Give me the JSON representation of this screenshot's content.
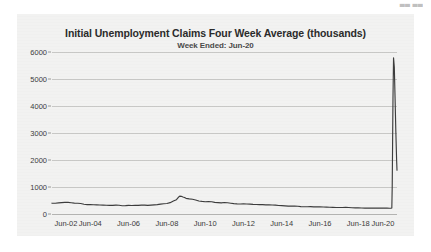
{
  "watermark_fragment": "▄▄ ▄▄",
  "chart_data": {
    "type": "line",
    "title": "Initial Unemployment Claims Four Week Average (thousands)",
    "subtitle": "Week Ended:  Jun-20",
    "xlabel": "",
    "ylabel": "",
    "grid": true,
    "legend": "none",
    "ylim": [
      0,
      6000
    ],
    "yticks": [
      0,
      1000,
      2000,
      3000,
      4000,
      5000,
      6000
    ],
    "ytick_labels": [
      "0",
      "1000",
      "2000",
      "3000",
      "4000",
      "5000",
      "6000"
    ],
    "xlim": [
      2002.45,
      2020.47
    ],
    "xticks": [
      2002.45,
      2004.45,
      2006.45,
      2008.45,
      2010.45,
      2012.45,
      2014.45,
      2016.45,
      2018.45,
      2020.45
    ],
    "xtick_labels": [
      "Jun-02",
      "Jun-04",
      "Jun-06",
      "Jun-08",
      "Jun-10",
      "Jun-12",
      "Jun-14",
      "Jun-16",
      "Jun-18",
      "Jun-20"
    ],
    "series": [
      {
        "name": "Initial Unemployment Claims Four Week Average",
        "color": "#3d3d3d",
        "x": [
          2002.45,
          2002.62,
          2002.79,
          2002.95,
          2003.12,
          2003.29,
          2003.45,
          2003.62,
          2003.79,
          2003.95,
          2004.12,
          2004.29,
          2004.45,
          2004.62,
          2004.79,
          2004.95,
          2005.12,
          2005.29,
          2005.45,
          2005.62,
          2005.79,
          2005.95,
          2006.12,
          2006.29,
          2006.45,
          2006.62,
          2006.79,
          2006.95,
          2007.12,
          2007.29,
          2007.45,
          2007.62,
          2007.79,
          2007.95,
          2008.12,
          2008.29,
          2008.45,
          2008.62,
          2008.79,
          2008.95,
          2009.04,
          2009.12,
          2009.2,
          2009.29,
          2009.37,
          2009.45,
          2009.62,
          2009.79,
          2009.95,
          2010.12,
          2010.29,
          2010.45,
          2010.62,
          2010.79,
          2010.95,
          2011.12,
          2011.29,
          2011.45,
          2011.62,
          2011.79,
          2011.95,
          2012.12,
          2012.29,
          2012.45,
          2012.62,
          2012.79,
          2012.95,
          2013.12,
          2013.29,
          2013.45,
          2013.62,
          2013.79,
          2013.95,
          2014.12,
          2014.29,
          2014.45,
          2014.62,
          2014.79,
          2014.95,
          2015.12,
          2015.29,
          2015.45,
          2015.62,
          2015.79,
          2015.95,
          2016.12,
          2016.29,
          2016.45,
          2016.62,
          2016.79,
          2016.95,
          2017.12,
          2017.29,
          2017.45,
          2017.62,
          2017.79,
          2017.95,
          2018.12,
          2018.29,
          2018.45,
          2018.62,
          2018.79,
          2018.95,
          2019.12,
          2019.29,
          2019.45,
          2019.62,
          2019.79,
          2019.95,
          2020.08,
          2020.16,
          2020.2,
          2020.22,
          2020.24,
          2020.26,
          2020.29,
          2020.33,
          2020.37,
          2020.41,
          2020.45,
          2020.47
        ],
        "y": [
          400,
          398,
          410,
          420,
          430,
          428,
          418,
          405,
          398,
          388,
          360,
          348,
          345,
          342,
          338,
          332,
          330,
          325,
          322,
          320,
          330,
          324,
          305,
          310,
          318,
          316,
          320,
          322,
          330,
          328,
          322,
          330,
          340,
          348,
          365,
          380,
          388,
          420,
          480,
          530,
          610,
          660,
          655,
          630,
          610,
          580,
          560,
          545,
          520,
          480,
          465,
          455,
          460,
          455,
          430,
          420,
          410,
          425,
          415,
          400,
          382,
          375,
          372,
          378,
          370,
          368,
          358,
          352,
          348,
          345,
          340,
          338,
          332,
          330,
          315,
          308,
          300,
          290,
          295,
          292,
          288,
          275,
          270,
          268,
          272,
          265,
          262,
          268,
          260,
          255,
          250,
          245,
          242,
          240,
          242,
          244,
          240,
          232,
          228,
          226,
          222,
          218,
          220,
          218,
          216,
          220,
          215,
          218,
          216,
          214,
          213,
          225,
          998,
          2614,
          4265,
          5787,
          5430,
          4268,
          3040,
          2000,
          1620
        ]
      }
    ],
    "annotations": [
      {
        "label": "2009 recession peak",
        "x": 2009.12,
        "y": 660
      },
      {
        "label": "COVID-19 peak",
        "x": 2020.29,
        "y": 5787
      },
      {
        "label": "latest value",
        "x": 2020.47,
        "y": 1620
      }
    ],
    "colors": {
      "panel_background": "#f2f2f1",
      "page_background": "#ffffff",
      "gridline": "#c9c9c7",
      "line": "#3d3d3d",
      "tick_text": "#3b3b3b",
      "title_text": "#2b2b2b"
    }
  }
}
